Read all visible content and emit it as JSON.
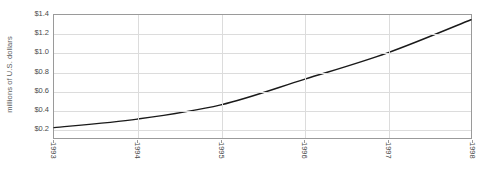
{
  "chart_data": {
    "type": "line",
    "title": "",
    "xlabel": "",
    "ylabel": "millions of U.S. dollars",
    "x": [
      1993,
      1994,
      1995,
      1996,
      1997,
      1998
    ],
    "categories": [
      "1993",
      "1994",
      "1995",
      "1996",
      "1997",
      "1998"
    ],
    "values": [
      0.21,
      0.3,
      0.45,
      0.72,
      1.0,
      1.35
    ],
    "series": [
      {
        "name": "millions of U.S. dollars",
        "values": [
          0.21,
          0.3,
          0.45,
          0.72,
          1.0,
          1.35
        ]
      }
    ],
    "ylim": [
      0.1,
      1.4
    ],
    "xlim": [
      1993,
      1998
    ],
    "yticks": [
      0.2,
      0.4,
      0.6,
      0.8,
      1.0,
      1.2,
      1.4
    ],
    "ytick_labels": [
      "$0.2",
      "$0.4",
      "$0.6",
      "$0.8",
      "$1.0",
      "$1.2",
      "$1.4"
    ],
    "xticks": [
      1993,
      1994,
      1995,
      1996,
      1997,
      1998
    ],
    "xtick_labels": [
      "1993",
      "1994",
      "1995",
      "1996",
      "1997",
      "1998"
    ],
    "grid": true,
    "legend": false,
    "legend_position": "none",
    "colors": {
      "line": "#1a1a1a",
      "gridline": "#dcdcdc",
      "axis": "#9a9a9a",
      "tick_text": "#4a4a4a",
      "axis_title": "#5c5c5c",
      "background": "#ffffff"
    }
  }
}
